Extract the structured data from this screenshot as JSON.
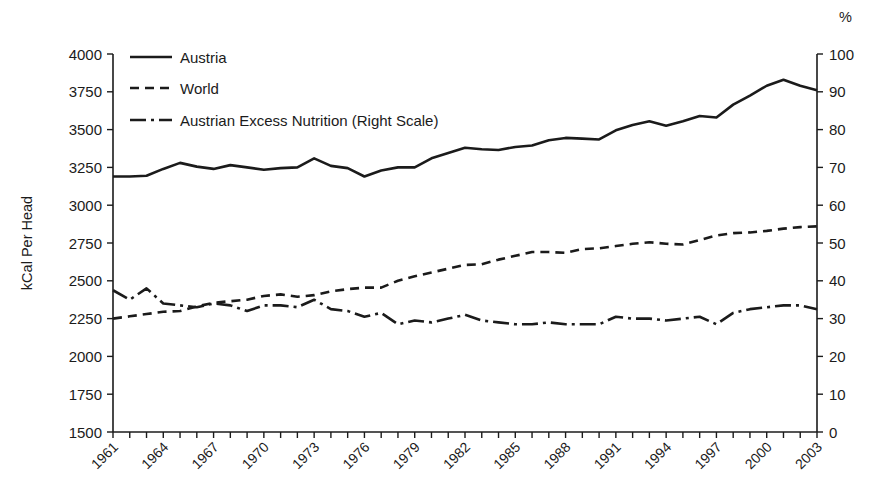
{
  "chart_data": {
    "type": "line",
    "title": "",
    "subtitle": "",
    "xlabel": "",
    "ylabel": "kCal Per Head",
    "y2label": "%",
    "grid": false,
    "legend_position": "top-left",
    "xlim": [
      1961,
      2003
    ],
    "ylim": [
      1500,
      4000
    ],
    "y2lim": [
      0,
      100
    ],
    "yticks": [
      1500,
      1750,
      2000,
      2250,
      2500,
      2750,
      3000,
      3250,
      3500,
      3750,
      4000
    ],
    "y2ticks": [
      0,
      10,
      20,
      30,
      40,
      50,
      60,
      70,
      80,
      90,
      100
    ],
    "x": [
      1961,
      1962,
      1963,
      1964,
      1965,
      1966,
      1967,
      1968,
      1969,
      1970,
      1971,
      1972,
      1973,
      1974,
      1975,
      1976,
      1977,
      1978,
      1979,
      1980,
      1981,
      1982,
      1983,
      1984,
      1985,
      1986,
      1987,
      1988,
      1989,
      1990,
      1991,
      1992,
      1993,
      1994,
      1995,
      1996,
      1997,
      1998,
      1999,
      2000,
      2001,
      2002,
      2003
    ],
    "xtick_labels": [
      "1961",
      "1964",
      "1967",
      "1970",
      "1973",
      "1976",
      "1979",
      "1982",
      "1985",
      "1988",
      "1991",
      "1994",
      "1997",
      "2000",
      "2003"
    ],
    "xtick_step": 3,
    "series": [
      {
        "name": "Austria",
        "axis": "left",
        "style": "solid",
        "values": [
          3190,
          3190,
          3195,
          3240,
          3280,
          3255,
          3240,
          3265,
          3250,
          3235,
          3245,
          3250,
          3310,
          3260,
          3245,
          3190,
          3230,
          3250,
          3250,
          3310,
          3345,
          3380,
          3370,
          3365,
          3385,
          3395,
          3430,
          3445,
          3440,
          3435,
          3495,
          3530,
          3555,
          3525,
          3555,
          3590,
          3580,
          3665,
          3725,
          3790,
          3830,
          3790,
          3760
        ]
      },
      {
        "name": "World",
        "axis": "left",
        "style": "dashed",
        "values": [
          2250,
          2265,
          2280,
          2295,
          2300,
          2330,
          2355,
          2365,
          2375,
          2400,
          2410,
          2395,
          2405,
          2430,
          2445,
          2455,
          2455,
          2500,
          2530,
          2555,
          2580,
          2605,
          2610,
          2640,
          2665,
          2690,
          2690,
          2685,
          2710,
          2715,
          2730,
          2745,
          2755,
          2745,
          2740,
          2770,
          2800,
          2815,
          2820,
          2830,
          2845,
          2855,
          2860
        ]
      },
      {
        "name": "Austrian Excess Nutrition (Right Scale)",
        "axis": "right",
        "style": "dashdot",
        "values": [
          37.5,
          35.0,
          38.0,
          34.0,
          33.5,
          33.0,
          34.0,
          33.5,
          32.0,
          33.5,
          33.5,
          33.0,
          35.0,
          32.5,
          32.0,
          30.5,
          31.5,
          28.5,
          29.5,
          29.0,
          30.0,
          31.0,
          29.5,
          29.0,
          28.5,
          28.5,
          29.0,
          28.5,
          28.5,
          28.5,
          30.5,
          30.0,
          30.0,
          29.5,
          30.0,
          30.5,
          28.5,
          31.5,
          32.5,
          33.0,
          33.5,
          33.5,
          32.5
        ]
      }
    ]
  },
  "legend": {
    "items": [
      {
        "label": "Austria",
        "style": "solid"
      },
      {
        "label": "World",
        "style": "dashed"
      },
      {
        "label": "Austrian Excess Nutrition (Right Scale)",
        "style": "dashdot"
      }
    ]
  },
  "axes": {
    "left_title": "kCal Per Head",
    "right_unit": "%"
  },
  "colors": {
    "ink": "#1b1b1b",
    "background": "#ffffff"
  }
}
